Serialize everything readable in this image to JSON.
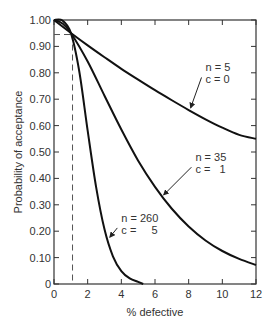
{
  "chart_data": {
    "type": "line",
    "title": "",
    "xlabel": "% defective",
    "ylabel": "Probability of acceptance",
    "xlim": [
      0,
      12
    ],
    "ylim": [
      0,
      1.0
    ],
    "grid": false,
    "legend": null,
    "x_ticks": [
      "0",
      "2",
      "4",
      "6",
      "8",
      "10",
      "12"
    ],
    "y_ticks": [
      "0",
      "0.10",
      "0.20",
      "0.30",
      "0.40",
      "0.50",
      "0.60",
      "0.70",
      "0.80",
      "0.90",
      "1.00"
    ],
    "series": [
      {
        "name": "n = 5, c = 0",
        "label_lines": [
          "n = 5",
          "c = 0"
        ],
        "x": [
          0,
          1,
          2,
          3,
          4,
          5,
          6,
          7,
          8,
          9,
          10,
          11,
          12
        ],
        "y": [
          1.0,
          0.951,
          0.904,
          0.859,
          0.815,
          0.774,
          0.734,
          0.696,
          0.659,
          0.624,
          0.592,
          0.565,
          0.55
        ]
      },
      {
        "name": "n = 35, c = 1",
        "label_lines": [
          "n = 35",
          "c =   1"
        ],
        "x": [
          0,
          0.5,
          1,
          2,
          3,
          4,
          5,
          6,
          7,
          8,
          9,
          10,
          11,
          12
        ],
        "y": [
          1.0,
          0.987,
          0.951,
          0.843,
          0.713,
          0.585,
          0.467,
          0.368,
          0.285,
          0.218,
          0.165,
          0.125,
          0.095,
          0.072
        ]
      },
      {
        "name": "n = 260, c = 5",
        "label_lines": [
          "n = 260",
          "c =     5"
        ],
        "x": [
          0,
          0.5,
          1,
          1.5,
          2,
          2.5,
          3,
          3.5,
          4,
          4.5,
          5,
          5.3
        ],
        "y": [
          1.0,
          0.998,
          0.951,
          0.806,
          0.581,
          0.368,
          0.207,
          0.105,
          0.049,
          0.021,
          0.008,
          0.0
        ]
      }
    ],
    "annotations": [
      {
        "type": "dashed-guide",
        "x": 1.1,
        "y": 0.945,
        "note": "vertical and horizontal dashed reference lines meeting at common point"
      },
      {
        "type": "arrow-label",
        "series": "n = 5, c = 0",
        "text_x": 9.0,
        "text_y": 0.79,
        "arrow_to_x": 8.0,
        "arrow_to_y": 0.66
      },
      {
        "type": "arrow-label",
        "series": "n = 35, c = 1",
        "text_x": 8.4,
        "text_y": 0.45,
        "arrow_to_x": 6.4,
        "arrow_to_y": 0.33
      },
      {
        "type": "arrow-label",
        "series": "n = 260, c = 5",
        "text_x": 4.0,
        "text_y": 0.22,
        "arrow_to_x": 3.2,
        "arrow_to_y": 0.17
      }
    ]
  },
  "labels": {
    "xlabel": "% defective",
    "ylabel": "Probability of acceptance"
  }
}
